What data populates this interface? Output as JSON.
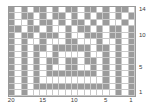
{
  "chart_data": {
    "type": "heatmap",
    "title": "",
    "xlabel": "",
    "ylabel": "",
    "columns": 20,
    "rows": 14,
    "x_tick_labels": [
      "20",
      "15",
      "10",
      "5",
      "1"
    ],
    "x_tick_columns": [
      20,
      15,
      10,
      5,
      1
    ],
    "y_tick_labels": [
      "14",
      "10",
      "5",
      "1"
    ],
    "y_tick_rows": [
      14,
      10,
      5,
      1
    ],
    "x_axis_direction": "right-to-left",
    "y_axis_direction": "bottom-to-top",
    "grid": true,
    "legend": "none",
    "colors": {
      "background": "#ffffff",
      "filled": "#9b9b9b",
      "empty": "#ffffff",
      "gridline": "#c9c9c9",
      "border": "#9a9a9a",
      "text": "#3a3a3a"
    },
    "value_labels": {
      "0": "empty",
      "1": "filled"
    },
    "cells": [
      [
        1,
        0,
        1,
        0,
        1,
        1,
        0,
        1,
        0,
        1,
        1,
        0,
        1,
        1,
        0,
        1,
        0,
        1,
        1,
        0
      ],
      [
        1,
        0,
        1,
        1,
        0,
        1,
        0,
        1,
        1,
        0,
        1,
        0,
        1,
        0,
        1,
        1,
        0,
        1,
        0,
        1
      ],
      [
        1,
        0,
        0,
        1,
        0,
        1,
        1,
        0,
        1,
        0,
        1,
        1,
        0,
        1,
        0,
        1,
        0,
        0,
        1,
        0
      ],
      [
        1,
        1,
        0,
        1,
        1,
        0,
        1,
        0,
        0,
        1,
        0,
        1,
        1,
        0,
        1,
        0,
        1,
        1,
        0,
        1
      ],
      [
        1,
        0,
        1,
        1,
        0,
        1,
        1,
        1,
        0,
        1,
        0,
        0,
        1,
        1,
        1,
        0,
        1,
        1,
        0,
        1
      ],
      [
        1,
        0,
        1,
        0,
        0,
        1,
        0,
        0,
        0,
        1,
        1,
        0,
        0,
        0,
        1,
        0,
        0,
        1,
        0,
        1
      ],
      [
        1,
        0,
        1,
        0,
        1,
        1,
        0,
        1,
        1,
        1,
        1,
        1,
        1,
        0,
        1,
        1,
        0,
        1,
        0,
        1
      ],
      [
        1,
        0,
        1,
        0,
        1,
        0,
        0,
        1,
        0,
        0,
        0,
        0,
        1,
        0,
        0,
        1,
        0,
        1,
        0,
        1
      ],
      [
        1,
        0,
        1,
        0,
        1,
        0,
        1,
        1,
        0,
        1,
        1,
        0,
        1,
        1,
        0,
        1,
        0,
        1,
        0,
        1
      ],
      [
        1,
        0,
        1,
        0,
        1,
        0,
        1,
        0,
        0,
        1,
        1,
        0,
        0,
        1,
        0,
        1,
        0,
        1,
        0,
        1
      ],
      [
        1,
        0,
        1,
        0,
        1,
        0,
        1,
        1,
        1,
        1,
        1,
        1,
        1,
        1,
        0,
        1,
        0,
        1,
        0,
        1
      ],
      [
        1,
        0,
        1,
        0,
        1,
        0,
        0,
        0,
        0,
        0,
        0,
        0,
        0,
        0,
        0,
        1,
        0,
        1,
        0,
        1
      ],
      [
        1,
        0,
        1,
        0,
        1,
        1,
        1,
        1,
        1,
        1,
        1,
        1,
        1,
        1,
        1,
        1,
        0,
        1,
        0,
        1
      ],
      [
        1,
        0,
        1,
        0,
        0,
        0,
        0,
        0,
        0,
        0,
        0,
        0,
        0,
        0,
        0,
        0,
        0,
        1,
        0,
        1
      ]
    ]
  }
}
